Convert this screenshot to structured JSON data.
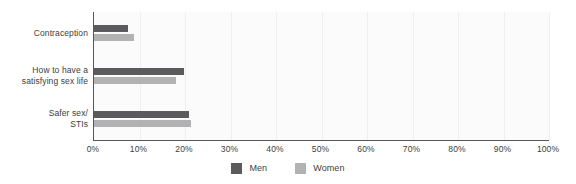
{
  "chart_data": {
    "type": "bar",
    "orientation": "horizontal",
    "title": "",
    "xlabel": "",
    "ylabel": "",
    "categories": [
      "Contraception",
      "How to have a satisfying sex life",
      "Safer sex/ STIs"
    ],
    "category_lines": [
      [
        "Contraception"
      ],
      [
        "How to have a",
        "satisfying sex life"
      ],
      [
        "Safer sex/",
        "STIs"
      ]
    ],
    "series": [
      {
        "name": "Men",
        "color": "#5b5b5d",
        "values": [
          7.5,
          19.8,
          20.9
        ]
      },
      {
        "name": "Women",
        "color": "#b2b2b2",
        "values": [
          8.8,
          18.0,
          21.3
        ]
      }
    ],
    "xlim": [
      0,
      100
    ],
    "xticks": [
      0,
      10,
      20,
      30,
      40,
      50,
      60,
      70,
      80,
      90,
      100
    ],
    "xtick_labels": [
      "0%",
      "10%",
      "20%",
      "30%",
      "40%",
      "50%",
      "60%",
      "70%",
      "80%",
      "90%",
      "100%"
    ],
    "grid": true,
    "grid_axis": "x",
    "legend_position": "bottom",
    "plot_background": "#fbfbfb",
    "axis_color": "#55565a",
    "gridline_color": "#efefef"
  },
  "legend": {
    "items": [
      {
        "label": "Men",
        "color": "#5b5b5d"
      },
      {
        "label": "Women",
        "color": "#b2b2b2"
      }
    ]
  }
}
